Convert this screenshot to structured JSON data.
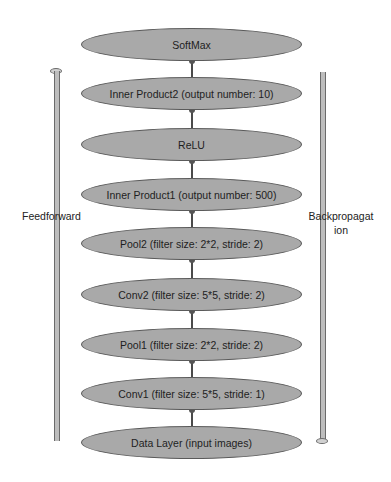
{
  "diagram": {
    "layers": [
      {
        "label": "SoftMax",
        "top": 28
      },
      {
        "label": "Inner Product2 (output number: 10)",
        "top": 77
      },
      {
        "label": "ReLU",
        "top": 128
      },
      {
        "label": "Inner Product1 (output number: 500)",
        "top": 178
      },
      {
        "label": "Pool2 (filter size: 2*2, stride: 2)",
        "top": 227
      },
      {
        "label": "Conv2 (filter size: 5*5, stride: 2)",
        "top": 278
      },
      {
        "label": "Pool1 (filter size: 2*2, stride: 2)",
        "top": 328
      },
      {
        "label": "Conv1 (filter size: 5*5, stride: 1)",
        "top": 377
      },
      {
        "label": "Data Layer (input images)",
        "top": 426
      }
    ],
    "left_arrow": {
      "label": "Feedforward",
      "direction": "up"
    },
    "right_arrow": {
      "label_line1": "Backpropagat",
      "label_line2": "ion",
      "direction": "down"
    },
    "colors": {
      "fill": "#a9a9a9",
      "stroke": "#5a5a5a",
      "text": "#1e1e1e"
    }
  }
}
